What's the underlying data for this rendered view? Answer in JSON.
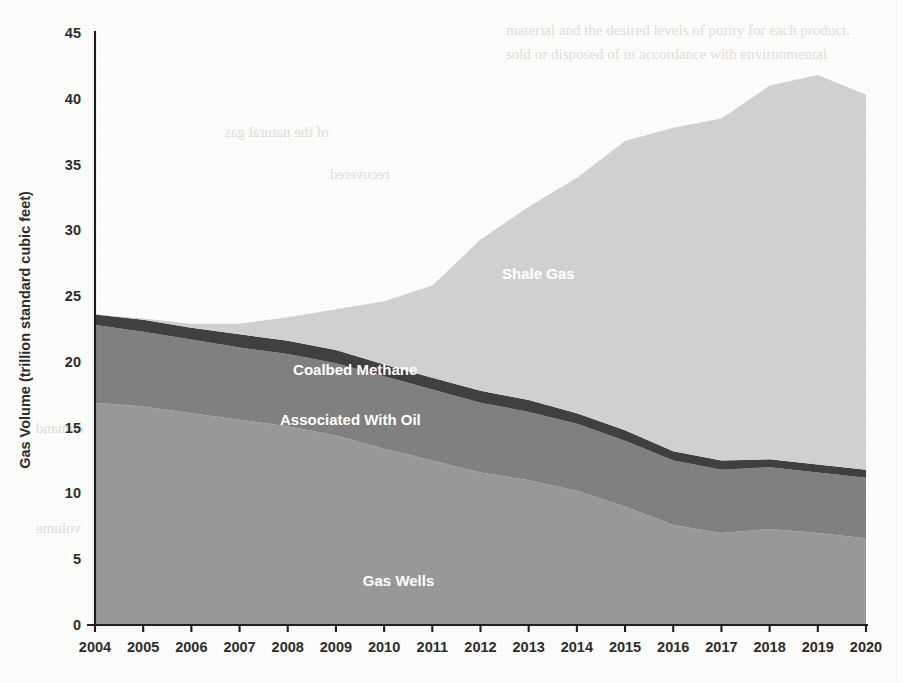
{
  "page": {
    "background_color": "#fdfdfc",
    "bleed_through_texts": [
      {
        "text": "material and the desired levels of purity for each product.",
        "x": 506,
        "y": 22,
        "size": 15,
        "mirrored": false
      },
      {
        "text": "sold or disposed of in accordance with environmental",
        "x": 506,
        "y": 46,
        "size": 15,
        "mirrored": false
      },
      {
        "text": "Natural Gas Applications",
        "x": 520,
        "y": 230,
        "size": 19,
        "mirrored": false
      },
      {
        "text": "The largest use of natural gas is for fuel in",
        "x": 506,
        "y": 268,
        "size": 15,
        "mirrored": false
      },
      {
        "text": "residential and commercial heating and in",
        "x": 506,
        "y": 292,
        "size": 15,
        "mirrored": false
      },
      {
        "text": "industrial and electric power generation.",
        "x": 506,
        "y": 316,
        "size": 15,
        "mirrored": false
      },
      {
        "text": "Natural gas is also a feedstock for chemical",
        "x": 506,
        "y": 340,
        "size": 15,
        "mirrored": false
      },
      {
        "text": "production and fertilizer manufacture.",
        "x": 506,
        "y": 364,
        "size": 15,
        "mirrored": false
      },
      {
        "text": "demand",
        "x": 36,
        "y": 420,
        "size": 15,
        "mirrored": true
      },
      {
        "text": "volume",
        "x": 36,
        "y": 520,
        "size": 15,
        "mirrored": true
      },
      {
        "text": "of the natural gas",
        "x": 225,
        "y": 124,
        "size": 15,
        "mirrored": true
      },
      {
        "text": "recovered",
        "x": 330,
        "y": 166,
        "size": 15,
        "mirrored": true
      }
    ]
  },
  "chart_data": {
    "type": "area",
    "stacked": true,
    "title": "",
    "subtitle": "",
    "xlabel": "",
    "ylabel": "Gas Volume (trillion standard cubic feet)",
    "xlim": [
      2004,
      2020
    ],
    "ylim": [
      0,
      45
    ],
    "ytick_step": 5,
    "yticks": [
      0,
      5,
      10,
      15,
      20,
      25,
      30,
      35,
      40,
      45
    ],
    "grid": false,
    "legend_position": "inline-labels",
    "x": [
      2004,
      2005,
      2006,
      2007,
      2008,
      2009,
      2010,
      2011,
      2012,
      2013,
      2014,
      2015,
      2016,
      2017,
      2018,
      2019,
      2020
    ],
    "categories": [
      "2004",
      "2005",
      "2006",
      "2007",
      "2008",
      "2009",
      "2010",
      "2011",
      "2012",
      "2013",
      "2014",
      "2015",
      "2016",
      "2017",
      "2018",
      "2019",
      "2020"
    ],
    "series": [
      {
        "name": "Gas Wells",
        "color": "#989898",
        "label_x": 2010.3,
        "label_y": 3.0,
        "values": [
          16.9,
          16.6,
          16.1,
          15.6,
          15.1,
          14.4,
          13.4,
          12.5,
          11.6,
          11.0,
          10.2,
          9.0,
          7.6,
          7.0,
          7.3,
          7.0,
          6.6
        ]
      },
      {
        "name": "Associated With Oil",
        "color": "#808080",
        "label_x": 2009.3,
        "label_y": 15.2,
        "values": [
          5.9,
          5.7,
          5.6,
          5.5,
          5.5,
          5.5,
          5.5,
          5.4,
          5.3,
          5.2,
          5.1,
          5.0,
          4.9,
          4.8,
          4.7,
          4.6,
          4.6
        ]
      },
      {
        "name": "Coalbed Methane",
        "color": "#404040",
        "label_x": 2009.4,
        "label_y": 19.0,
        "values": [
          0.8,
          0.9,
          0.9,
          1.0,
          1.0,
          1.0,
          0.9,
          0.9,
          0.9,
          0.9,
          0.8,
          0.8,
          0.7,
          0.7,
          0.6,
          0.6,
          0.6
        ]
      },
      {
        "name": "Shale Gas",
        "color": "#d0d0d0",
        "label_x": 2013.2,
        "label_y": 26.3,
        "values": [
          0.0,
          0.1,
          0.3,
          0.8,
          1.8,
          3.1,
          4.8,
          7.0,
          11.5,
          14.7,
          17.9,
          22.0,
          24.6,
          26.0,
          28.4,
          29.6,
          28.5
        ]
      }
    ],
    "totals": [
      23.6,
      23.3,
      22.9,
      22.9,
      23.4,
      24.0,
      24.6,
      25.8,
      29.3,
      31.8,
      34.0,
      36.8,
      37.8,
      38.5,
      41.0,
      41.8,
      40.3
    ],
    "axis_color": "#1e1e1e",
    "tick_label_color": "#2c2c2c",
    "series_label_color": "#ffffff"
  }
}
